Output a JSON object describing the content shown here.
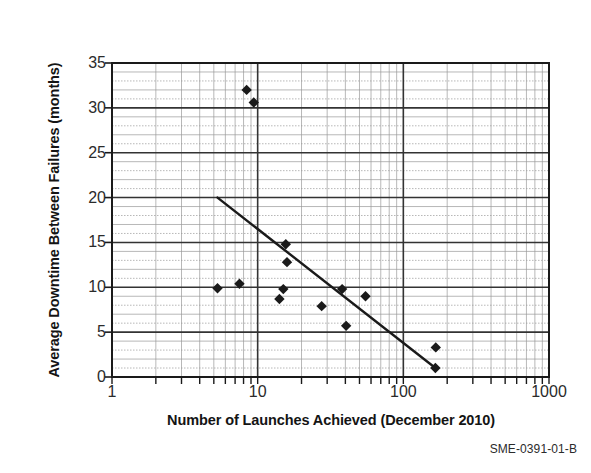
{
  "chart_data": {
    "type": "scatter",
    "title": "",
    "xlabel": "Number of Launches Achieved (December 2010)",
    "ylabel": "Average Downtime Between Failures (months)",
    "caption": "SME-0391-01-B",
    "xscale": "log",
    "yscale": "linear",
    "xlim": [
      1,
      1000
    ],
    "ylim": [
      0,
      35
    ],
    "xticks": [
      "1",
      "10",
      "100",
      "1000"
    ],
    "xtick_values": [
      1,
      10,
      100,
      1000
    ],
    "yticks": [
      "0",
      "5",
      "10",
      "15",
      "20",
      "25",
      "30",
      "35"
    ],
    "ytick_values": [
      0,
      5,
      10,
      15,
      20,
      25,
      30,
      35
    ],
    "grid": true,
    "grid_minor": true,
    "legend": null,
    "marker": "diamond",
    "marker_color": "#1a1a1a",
    "points": [
      {
        "x": 8.4,
        "y": 32.0
      },
      {
        "x": 9.4,
        "y": 30.6
      },
      {
        "x": 5.3,
        "y": 9.9
      },
      {
        "x": 7.5,
        "y": 10.4
      },
      {
        "x": 15.6,
        "y": 14.8
      },
      {
        "x": 15.9,
        "y": 12.8
      },
      {
        "x": 15.0,
        "y": 9.8
      },
      {
        "x": 14.1,
        "y": 8.7
      },
      {
        "x": 27.5,
        "y": 7.9
      },
      {
        "x": 38.0,
        "y": 9.8
      },
      {
        "x": 40.5,
        "y": 5.7
      },
      {
        "x": 55.0,
        "y": 9.0
      },
      {
        "x": 167.0,
        "y": 3.3
      },
      {
        "x": 166.0,
        "y": 1.0
      }
    ],
    "trend_line": {
      "x_start": 5.3,
      "y_start": 20.0,
      "x_end": 166.0,
      "y_end": 1.0,
      "color": "#1a1a1a",
      "width": 2.4
    }
  }
}
